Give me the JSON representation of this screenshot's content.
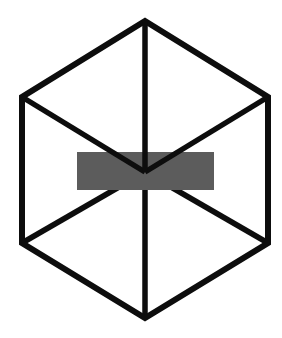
{
  "canvas": {
    "width": 282,
    "height": 338,
    "background_color": "#FFFFFF"
  },
  "figure": {
    "name": "Necker cube hexagon wireframe with gray occluding bar",
    "stroke_color": "#0D0D0D",
    "stroke_width": 6,
    "stroke_width_interior": 5.5,
    "line_join": "miter",
    "line_cap": "butt"
  },
  "geometry": {
    "center": {
      "x": 145,
      "y": 172
    },
    "hexagon_vertices": [
      {
        "name": "top",
        "x": 145,
        "y": 21
      },
      {
        "name": "top-right",
        "x": 268,
        "y": 97
      },
      {
        "name": "bottom-right",
        "x": 268,
        "y": 243
      },
      {
        "name": "bottom",
        "x": 145,
        "y": 318
      },
      {
        "name": "bottom-left",
        "x": 22,
        "y": 243
      },
      {
        "name": "top-left",
        "x": 22,
        "y": 97
      }
    ],
    "hexagon_path": "M145,21 L268,97 L268,243 L145,318 L22,243 L22,97 Z",
    "interior_spokes": [
      {
        "name": "spoke-to-top",
        "from": "center",
        "to": "top",
        "path": "M145,172 L145,21"
      },
      {
        "name": "spoke-to-top-left",
        "from": "center",
        "to": "top-left",
        "path": "M145,172 L22,97"
      },
      {
        "name": "spoke-to-top-right",
        "from": "center",
        "to": "top-right",
        "path": "M145,172 L268,97"
      },
      {
        "name": "spoke-to-bottom",
        "from": "center",
        "to": "bottom",
        "path": "M145,172 L145,318"
      },
      {
        "name": "spoke-to-bottom-left",
        "from": "center",
        "to": "bottom-left",
        "path": "M145,172 L22,243"
      },
      {
        "name": "spoke-to-bottom-right",
        "from": "center",
        "to": "bottom-right",
        "path": "M145,172 L268,243"
      }
    ]
  },
  "occluder": {
    "name": "gray-bar",
    "shape": "rectangle",
    "fill_color": "#5C5C5C",
    "x": 77,
    "y": 152,
    "width": 137,
    "height": 38
  },
  "layering": {
    "order": [
      "hexagon-outline",
      "lower-spokes",
      "gray-bar",
      "upper-spokes"
    ],
    "note": "Gray bar covers the lower spokes and the central junction of the upper spokes"
  },
  "chart_data": {
    "type": "diagram",
    "title": "",
    "elements": [
      {
        "id": "hexagon",
        "kind": "polygon",
        "sides": 6,
        "color": "#0D0D0D"
      },
      {
        "id": "spokes",
        "kind": "lines",
        "count": 6,
        "color": "#0D0D0D"
      },
      {
        "id": "gray-bar",
        "kind": "rect",
        "color": "#5C5C5C"
      }
    ]
  }
}
